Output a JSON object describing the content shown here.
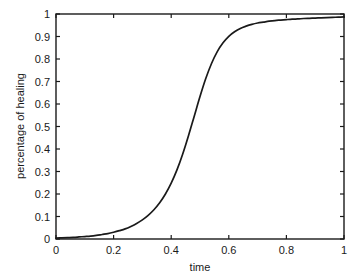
{
  "chart_data": {
    "type": "line",
    "title": "",
    "xlabel": "time",
    "ylabel": "percentage of healing",
    "xlim": [
      0,
      1
    ],
    "ylim": [
      0,
      1
    ],
    "grid": false,
    "legend": null,
    "x_ticks": [
      "0",
      "0.2",
      "0.4",
      "0.6",
      "0.8",
      "1"
    ],
    "x_tick_values": [
      0,
      0.2,
      0.4,
      0.6,
      0.8,
      1
    ],
    "y_ticks": [
      "0",
      "0.1",
      "0.2",
      "0.3",
      "0.4",
      "0.5",
      "0.6",
      "0.7",
      "0.8",
      "0.9",
      "1"
    ],
    "y_tick_values": [
      0,
      0.1,
      0.2,
      0.3,
      0.4,
      0.5,
      0.6,
      0.7,
      0.8,
      0.9,
      1
    ],
    "series": [
      {
        "name": "percentage of healing",
        "color": "#1a1a1a",
        "x": [
          0.0,
          0.02,
          0.04,
          0.06,
          0.08,
          0.1,
          0.12,
          0.14,
          0.16,
          0.18,
          0.2,
          0.22,
          0.24,
          0.26,
          0.28,
          0.3,
          0.32,
          0.34,
          0.36,
          0.38,
          0.4,
          0.42,
          0.44,
          0.46,
          0.48,
          0.5,
          0.52,
          0.54,
          0.56,
          0.58,
          0.6,
          0.62,
          0.64,
          0.66,
          0.68,
          0.7,
          0.72,
          0.74,
          0.76,
          0.78,
          0.8,
          0.82,
          0.84,
          0.86,
          0.88,
          0.9,
          0.92,
          0.94,
          0.96,
          0.98,
          1.0
        ],
        "y": [
          0.004,
          0.005,
          0.006,
          0.007,
          0.009,
          0.011,
          0.013,
          0.016,
          0.02,
          0.024,
          0.03,
          0.037,
          0.045,
          0.056,
          0.069,
          0.085,
          0.105,
          0.13,
          0.161,
          0.2,
          0.248,
          0.307,
          0.378,
          0.459,
          0.546,
          0.633,
          0.713,
          0.78,
          0.833,
          0.872,
          0.901,
          0.921,
          0.936,
          0.946,
          0.954,
          0.96,
          0.964,
          0.968,
          0.971,
          0.973,
          0.975,
          0.977,
          0.978,
          0.98,
          0.981,
          0.982,
          0.983,
          0.984,
          0.985,
          0.986,
          0.987
        ]
      }
    ]
  },
  "axes": {
    "x_label": "time",
    "y_label": "percentage of healing"
  }
}
